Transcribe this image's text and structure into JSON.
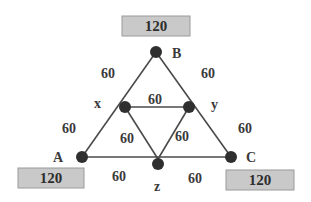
{
  "diagram": {
    "nodes": {
      "A": {
        "label": "A",
        "x": 82,
        "y": 157
      },
      "B": {
        "label": "B",
        "x": 156,
        "y": 52
      },
      "C": {
        "label": "C",
        "x": 231,
        "y": 157
      },
      "x": {
        "label": "x",
        "x": 125,
        "y": 107
      },
      "y": {
        "label": "y",
        "x": 189,
        "y": 107
      },
      "z": {
        "label": "z",
        "x": 158,
        "y": 164
      }
    },
    "edge_weights": {
      "B_x": "60",
      "B_y": "60",
      "x_A": "60",
      "y_C": "60",
      "x_y": "60",
      "x_z": "60",
      "y_z": "60",
      "A_z": "60",
      "z_C": "60"
    },
    "boxes": {
      "A": "120",
      "B": "120",
      "C": "120"
    },
    "colors": {
      "node": "#2f2f2f",
      "edge": "#4a4a4a",
      "box_fill": "#c9c9c9",
      "box_border": "#9a9a9a",
      "text": "#3a3a3a"
    }
  }
}
